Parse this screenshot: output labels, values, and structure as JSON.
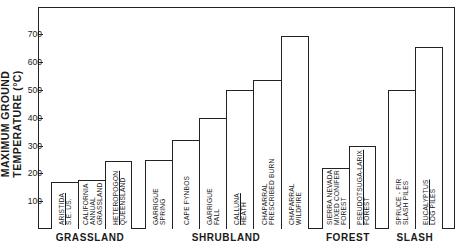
{
  "chart_data": {
    "type": "bar",
    "title": "",
    "xlabel": "",
    "ylabel": "MAXIMUM GROUND TEMPERATURE (°C)",
    "ylim": [
      0,
      800
    ],
    "yticks": [
      100,
      200,
      300,
      400,
      500,
      600,
      700
    ],
    "grid": false,
    "legend": null,
    "groups": [
      {
        "name": "GRASSLAND",
        "bars": [
          {
            "label": [
              "ARISTIDA",
              "S.E. US."
            ],
            "underline_first": true,
            "value": 170
          },
          {
            "label": [
              "CALIFORNIA",
              "ANNUAL",
              "GRASSLAND"
            ],
            "underline_first": false,
            "value": 175
          },
          {
            "label": [
              "HETEROPOGON",
              "QUEENSLAND"
            ],
            "underline_first": true,
            "value": 245
          }
        ]
      },
      {
        "name": "SHRUBLAND",
        "bars": [
          {
            "label": [
              "GARRIGUE",
              "SPRING"
            ],
            "underline_first": false,
            "value": 250
          },
          {
            "label": [
              "CAPE FYNBOS"
            ],
            "underline_first": false,
            "value": 320
          },
          {
            "label": [
              "GARRIGUE",
              "FALL"
            ],
            "underline_first": false,
            "value": 400
          },
          {
            "label": [
              "CALLUNA",
              "HEATH"
            ],
            "underline_first": true,
            "value": 500
          },
          {
            "label": [
              "CHAPARRAL",
              "PRESCRIBED BURN"
            ],
            "underline_first": false,
            "value": 535
          },
          {
            "label": [
              "CHAPARRAL",
              "WILDFIRE"
            ],
            "underline_first": false,
            "value": 695
          }
        ]
      },
      {
        "name": "FOREST",
        "bars": [
          {
            "label": [
              "SIERRA NEVADA",
              "MIXED CONIFER",
              "FOREST"
            ],
            "underline_first": false,
            "value": 220
          },
          {
            "label": [
              "PSEUDOTSUGA-LARIX",
              "FOREST"
            ],
            "underline_first": true,
            "value": 300
          }
        ]
      },
      {
        "name": "SLASH",
        "bars": [
          {
            "label": [
              "SPRUCE - FIR",
              "SLASH PILES"
            ],
            "underline_first": false,
            "value": 500
          },
          {
            "label": [
              "EUCALYPTUS",
              "LOG PILES"
            ],
            "underline_first": true,
            "value": 655
          }
        ]
      }
    ],
    "categories": [
      "Aristida S.E. US.",
      "California Annual Grassland",
      "Heteropogon Queensland",
      "Garrigue Spring",
      "Cape Fynbos",
      "Garrigue Fall",
      "Calluna Heath",
      "Chaparral Prescribed Burn",
      "Chaparral Wildfire",
      "Sierra Nevada Mixed Conifer Forest",
      "Pseudotsuga-Larix Forest",
      "Spruce-Fir Slash Piles",
      "Eucalyptus Log Piles"
    ],
    "values": [
      170,
      175,
      245,
      250,
      320,
      400,
      500,
      535,
      695,
      220,
      300,
      500,
      655
    ]
  },
  "layout": {
    "baseline_y": 229,
    "px_per_unit": 0.278,
    "bar_x": [
      [
        51,
        78
      ],
      [
        78,
        105
      ],
      [
        105,
        131
      ],
      [
        145,
        172
      ],
      [
        172,
        199
      ],
      [
        199,
        226
      ],
      [
        226,
        253
      ],
      [
        253,
        281
      ],
      [
        281,
        308
      ],
      [
        322,
        349
      ],
      [
        349,
        375
      ],
      [
        388,
        415
      ],
      [
        415,
        442
      ]
    ],
    "group_centers": [
      90,
      226,
      348,
      415
    ]
  }
}
